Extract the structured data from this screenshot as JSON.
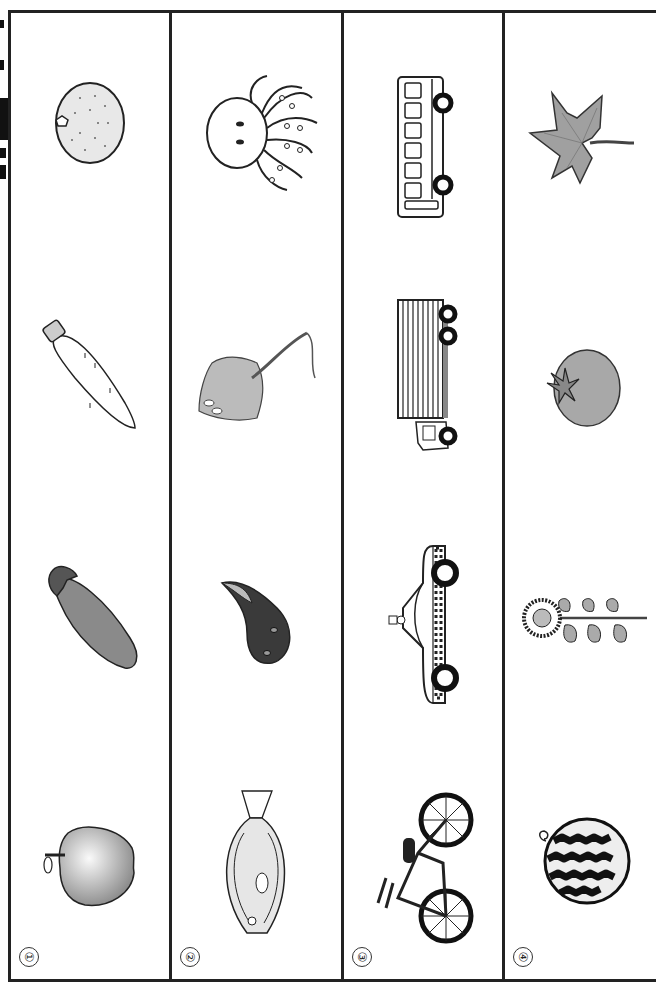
{
  "page": {
    "type": "worksheet",
    "orientation": "rotated-90",
    "border_color": "#222222"
  },
  "columns": [
    {
      "number": "①",
      "category": "fruits-and-vegetables",
      "items": [
        {
          "name": "mandarin orange",
          "icon": "orange-icon"
        },
        {
          "name": "daikon radish",
          "icon": "daikon-icon"
        },
        {
          "name": "eggplant",
          "icon": "eggplant-icon"
        },
        {
          "name": "apple",
          "icon": "apple-icon"
        }
      ]
    },
    {
      "number": "②",
      "category": "sea-creatures",
      "items": [
        {
          "name": "octopus",
          "icon": "octopus-icon"
        },
        {
          "name": "stingray",
          "icon": "stingray-icon"
        },
        {
          "name": "tadpole / seal",
          "icon": "tadpole-icon"
        },
        {
          "name": "flounder",
          "icon": "flounder-icon"
        }
      ]
    },
    {
      "number": "③",
      "category": "vehicles",
      "items": [
        {
          "name": "bus",
          "icon": "bus-icon"
        },
        {
          "name": "truck",
          "icon": "truck-icon"
        },
        {
          "name": "taxi",
          "icon": "taxi-icon"
        },
        {
          "name": "bicycle",
          "icon": "bicycle-icon"
        }
      ]
    },
    {
      "number": "④",
      "category": "seasons",
      "items": [
        {
          "name": "maple leaf",
          "icon": "maple-leaf-icon"
        },
        {
          "name": "tomato",
          "icon": "tomato-icon"
        },
        {
          "name": "sunflower",
          "icon": "sunflower-icon"
        },
        {
          "name": "watermelon",
          "icon": "watermelon-icon"
        }
      ]
    }
  ],
  "colors": {
    "gray_fill": "#a0a0a0",
    "dark_fill": "#3a3a3a",
    "line": "#222222"
  }
}
